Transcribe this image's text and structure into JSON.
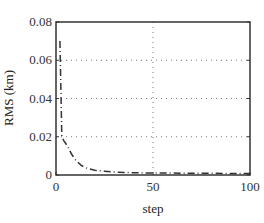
{
  "chart_data": {
    "type": "line",
    "title": "",
    "xlabel": "step",
    "ylabel": "RMS (km)",
    "xlim": [
      0,
      100
    ],
    "ylim": [
      0,
      0.08
    ],
    "xticks": [
      0,
      50,
      100
    ],
    "xtick_labels": [
      "0",
      "50",
      "100"
    ],
    "yticks": [
      0,
      0.02,
      0.04,
      0.06,
      0.08
    ],
    "ytick_labels": [
      "0",
      "0.02",
      "0.04",
      "0.06",
      "0.08"
    ],
    "grid": "dotted",
    "legend": null,
    "series": [
      {
        "name": "RMS",
        "style": "dash-dot",
        "color": "#333333",
        "x": [
          2,
          2.5,
          3,
          4,
          6,
          8,
          10,
          13,
          16,
          20,
          25,
          30,
          40,
          50,
          60,
          70,
          80,
          90,
          100
        ],
        "y": [
          0.07,
          0.045,
          0.02,
          0.018,
          0.015,
          0.011,
          0.008,
          0.005,
          0.0035,
          0.0025,
          0.002,
          0.0015,
          0.0012,
          0.001,
          0.001,
          0.0009,
          0.0009,
          0.0008,
          0.0008
        ]
      }
    ]
  }
}
